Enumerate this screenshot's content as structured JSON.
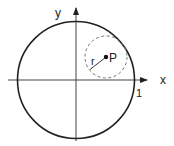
{
  "diagram": {
    "labels": {
      "x_axis": "x",
      "y_axis": "y",
      "point": "P",
      "radius": "r",
      "unit_mark": "1"
    },
    "colors": {
      "stroke": "#222222",
      "dashed": "#777777",
      "background": "#ffffff"
    },
    "geometry": {
      "origin": [
        76,
        80
      ],
      "unit_radius_px": 58,
      "point_P": [
        106,
        57
      ],
      "small_radius_px": 21
    }
  }
}
